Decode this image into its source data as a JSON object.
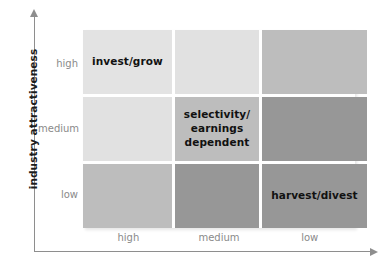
{
  "figure": {
    "title": "",
    "y_axis": {
      "title": "industry attractiveness",
      "ticks": [
        "high",
        "medium",
        "low"
      ],
      "arrow": "arrow-up"
    },
    "x_axis": {
      "title": "",
      "ticks": [
        "high",
        "medium",
        "low"
      ],
      "arrow": "arrow-right"
    }
  },
  "chart_data": {
    "type": "heatmap",
    "title": "",
    "xlabel": "",
    "ylabel": "industry attractiveness",
    "grid": true,
    "legend": "none",
    "x": [
      "high",
      "medium",
      "low"
    ],
    "y": [
      "high",
      "medium",
      "low"
    ],
    "cells": [
      {
        "row": "high",
        "col": "high",
        "label": "invest/grow",
        "color": "#e3e3e3",
        "value": 1
      },
      {
        "row": "high",
        "col": "medium",
        "label": "",
        "color": "#e1e1e1",
        "value": 1
      },
      {
        "row": "high",
        "col": "low",
        "label": "",
        "color": "#bdbdbd",
        "value": 2
      },
      {
        "row": "medium",
        "col": "high",
        "label": "",
        "color": "#e1e1e1",
        "value": 1
      },
      {
        "row": "medium",
        "col": "medium",
        "label": "selectivity/\nearnings\ndependent",
        "color": "#bdbdbd",
        "value": 2
      },
      {
        "row": "medium",
        "col": "low",
        "label": "",
        "color": "#979797",
        "value": 3
      },
      {
        "row": "low",
        "col": "high",
        "label": "",
        "color": "#bdbdbd",
        "value": 2
      },
      {
        "row": "low",
        "col": "medium",
        "label": "",
        "color": "#979797",
        "value": 3
      },
      {
        "row": "low",
        "col": "low",
        "label": "harvest/divest",
        "color": "#979797",
        "value": 3
      }
    ],
    "colors": {
      "light": "#e2e2e2",
      "medium": "#bdbdbd",
      "dark": "#979797",
      "axis": "#8e8e8e",
      "tick_text": "#8a8a8a",
      "cell_text": "#111111",
      "axis_title": "#1d1d1d",
      "background": "#ffffff"
    }
  }
}
